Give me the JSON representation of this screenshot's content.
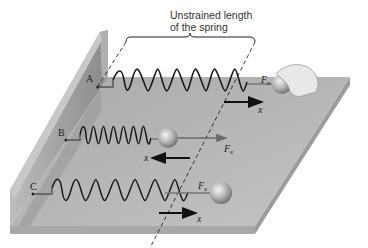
{
  "figure": {
    "caption_line1": "Unstrained length",
    "caption_line2": "of the spring",
    "springs": [
      {
        "id": "A",
        "label": "A",
        "state": "stretched",
        "force_label": "F",
        "force_sub": "x",
        "disp_label": "x",
        "force_direction": "right",
        "disp_direction": "right",
        "held_by": "hand"
      },
      {
        "id": "B",
        "label": "B",
        "state": "compressed",
        "force_label": "F",
        "force_sub": "x",
        "disp_label": "x",
        "force_direction": "right",
        "disp_direction": "left"
      },
      {
        "id": "C",
        "label": "C",
        "state": "stretched",
        "force_label": "F",
        "force_sub": "x",
        "disp_label": "x",
        "force_direction": "right",
        "disp_direction": "right"
      }
    ],
    "colors": {
      "platform_top": "#b3b3b3",
      "platform_edge": "#9a9a9a",
      "wall": "#8f8f8f",
      "wall_face": "#a5a5a5",
      "spring": "#1a1a1a",
      "arrow_displacement": "#111111",
      "arrow_force": "#6a6a6a"
    }
  }
}
